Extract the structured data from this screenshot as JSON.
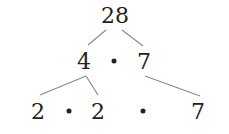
{
  "tree": {
    "root": {
      "label": "28"
    },
    "level1": [
      {
        "label": "4"
      },
      {
        "label": "7"
      }
    ],
    "level2": [
      {
        "label": "2"
      },
      {
        "label": "2"
      },
      {
        "label": "7"
      }
    ],
    "operator": "multiplication-dot"
  },
  "colors": {
    "text": "#222222",
    "lines": "#888888"
  }
}
